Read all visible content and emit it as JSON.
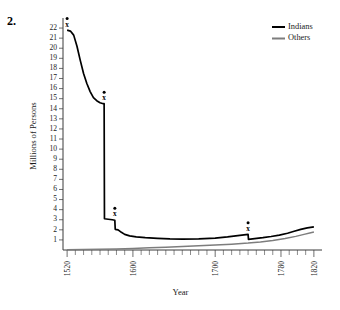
{
  "figure": {
    "number_label": "2."
  },
  "chart_data": {
    "type": "line",
    "title": "",
    "xlabel": "Year",
    "ylabel": "Millions of Persons",
    "xlim": [
      1515,
      1825
    ],
    "ylim": [
      0,
      22.6
    ],
    "grid": false,
    "legend_position": "top-right",
    "x_major_ticks": [
      1520,
      1600,
      1700,
      1780,
      1820
    ],
    "x_major_tick_labels": [
      "1520",
      "1600",
      "1700",
      "1780",
      "1820"
    ],
    "x_minor_tick_step": 10,
    "y_ticks": [
      1,
      2,
      3,
      4,
      5,
      6,
      7,
      8,
      9,
      10,
      11,
      12,
      13,
      14,
      15,
      16,
      17,
      18,
      19,
      20,
      21,
      22
    ],
    "y_tick_labels": [
      "1",
      "2",
      "3",
      "4",
      "5",
      "6",
      "7",
      "8",
      "9",
      "10",
      "11",
      "12",
      "13",
      "14",
      "15",
      "16",
      "17",
      "18",
      "19",
      "20",
      "21",
      "22"
    ],
    "series": [
      {
        "name": "Indians",
        "color": "#000000",
        "points": [
          [
            1520,
            21.8
          ],
          [
            1524,
            21.7
          ],
          [
            1528,
            21.3
          ],
          [
            1532,
            20.2
          ],
          [
            1536,
            18.8
          ],
          [
            1540,
            17.5
          ],
          [
            1544,
            16.5
          ],
          [
            1548,
            15.7
          ],
          [
            1552,
            15.1
          ],
          [
            1556,
            14.8
          ],
          [
            1560,
            14.6
          ],
          [
            1564,
            14.5
          ],
          [
            1565,
            14.5
          ],
          [
            1565.4,
            3.1
          ],
          [
            1570,
            3.05
          ],
          [
            1575,
            3.0
          ],
          [
            1578,
            2.95
          ],
          [
            1578.5,
            2.05
          ],
          [
            1582,
            2.0
          ],
          [
            1586,
            1.75
          ],
          [
            1590,
            1.55
          ],
          [
            1596,
            1.4
          ],
          [
            1604,
            1.3
          ],
          [
            1615,
            1.22
          ],
          [
            1630,
            1.15
          ],
          [
            1645,
            1.1
          ],
          [
            1660,
            1.08
          ],
          [
            1680,
            1.1
          ],
          [
            1700,
            1.18
          ],
          [
            1715,
            1.3
          ],
          [
            1730,
            1.45
          ],
          [
            1740,
            1.55
          ],
          [
            1740.5,
            1.05
          ],
          [
            1748,
            1.12
          ],
          [
            1758,
            1.22
          ],
          [
            1768,
            1.34
          ],
          [
            1778,
            1.48
          ],
          [
            1788,
            1.66
          ],
          [
            1796,
            1.86
          ],
          [
            1804,
            2.05
          ],
          [
            1812,
            2.2
          ],
          [
            1820,
            2.3
          ]
        ]
      },
      {
        "name": "Others",
        "color": "#7d7d7d",
        "points": [
          [
            1520,
            0.02
          ],
          [
            1540,
            0.04
          ],
          [
            1560,
            0.07
          ],
          [
            1580,
            0.11
          ],
          [
            1600,
            0.16
          ],
          [
            1620,
            0.22
          ],
          [
            1640,
            0.28
          ],
          [
            1660,
            0.34
          ],
          [
            1680,
            0.41
          ],
          [
            1700,
            0.49
          ],
          [
            1720,
            0.58
          ],
          [
            1740,
            0.69
          ],
          [
            1755,
            0.8
          ],
          [
            1770,
            0.94
          ],
          [
            1785,
            1.14
          ],
          [
            1798,
            1.35
          ],
          [
            1808,
            1.55
          ],
          [
            1815,
            1.68
          ],
          [
            1820,
            1.78
          ]
        ]
      }
    ],
    "annotations": [
      {
        "label": "x",
        "x": 1520,
        "y": 21.8
      },
      {
        "label": "x",
        "x": 1565,
        "y": 14.5
      },
      {
        "label": "x",
        "x": 1578,
        "y": 3.0
      },
      {
        "label": "x",
        "x": 1740,
        "y": 1.55
      }
    ]
  },
  "legend": {
    "items": [
      {
        "label": "Indians",
        "color": "#000000"
      },
      {
        "label": "Others",
        "color": "#7d7d7d"
      }
    ]
  }
}
